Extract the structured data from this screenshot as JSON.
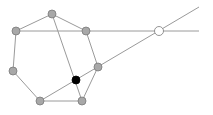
{
  "diagram": {
    "width": 213,
    "height": 115,
    "colors": {
      "line": "#9a9a9a",
      "vertex_fill": "#a8a8a8",
      "vertex_stroke": "#7a7a7a",
      "highlight_fill": "#000000",
      "open_fill": "#ffffff",
      "open_stroke": "#7a7a7a"
    },
    "points": [
      {
        "id": "A",
        "x": 52,
        "y": 14,
        "style": "vertex"
      },
      {
        "id": "B",
        "x": 16,
        "y": 31,
        "style": "vertex"
      },
      {
        "id": "C",
        "x": 86,
        "y": 31,
        "style": "vertex"
      },
      {
        "id": "D",
        "x": 13,
        "y": 71,
        "style": "vertex"
      },
      {
        "id": "E",
        "x": 98,
        "y": 67,
        "style": "vertex"
      },
      {
        "id": "F",
        "x": 40,
        "y": 101,
        "style": "vertex"
      },
      {
        "id": "G",
        "x": 82,
        "y": 101,
        "style": "vertex"
      },
      {
        "id": "P",
        "x": 76,
        "y": 80,
        "style": "highlight"
      },
      {
        "id": "Q",
        "x": 159,
        "y": 31,
        "style": "open"
      }
    ],
    "lines": [
      {
        "x1": 52,
        "y1": 14,
        "x2": 16,
        "y2": 31
      },
      {
        "x1": 52,
        "y1": 14,
        "x2": 86,
        "y2": 31
      },
      {
        "x1": 16,
        "y1": 31,
        "x2": 13,
        "y2": 71
      },
      {
        "x1": 13,
        "y1": 71,
        "x2": 40,
        "y2": 101
      },
      {
        "x1": 40,
        "y1": 101,
        "x2": 82,
        "y2": 101
      },
      {
        "x1": 82,
        "y1": 101,
        "x2": 98,
        "y2": 67
      },
      {
        "x1": 98,
        "y1": 67,
        "x2": 86,
        "y2": 31
      },
      {
        "x1": 52,
        "y1": 14,
        "x2": 82,
        "y2": 101
      },
      {
        "x1": 16,
        "y1": 31,
        "x2": 199,
        "y2": 31
      },
      {
        "x1": 40,
        "y1": 101,
        "x2": 199,
        "y2": 7
      }
    ]
  }
}
